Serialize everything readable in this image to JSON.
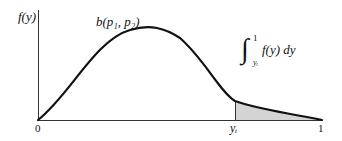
{
  "diagram": {
    "y_axis_label": "f(y)",
    "curve_label": "b(p₁, p₂)",
    "integral": {
      "sign": "∫",
      "upper": "1",
      "lower": "yᵢ",
      "integrand": "f(y) dy"
    },
    "x_ticks": {
      "origin": "0",
      "yi": "yᵢ",
      "end": "1"
    },
    "colors": {
      "line": "#111111",
      "shade": "#d4d4d4"
    }
  }
}
